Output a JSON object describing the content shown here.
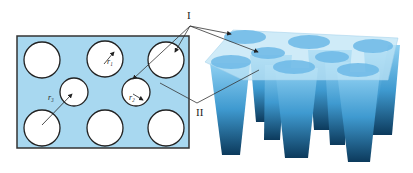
{
  "labels": {
    "region_I": "I",
    "region_II": "II",
    "r1": "r₁",
    "r2": "r₂",
    "r3": "r₃"
  },
  "colors": {
    "plate_fill": "#a8d8f0",
    "border": "#333333",
    "hole_fill": "#ffffff",
    "cone_top": "#7cc4ec",
    "cone_bottom": "#0d3f62"
  },
  "plan_view": {
    "large_holes": 6,
    "small_holes": 2
  },
  "perspective_view": {
    "cones": 8
  }
}
